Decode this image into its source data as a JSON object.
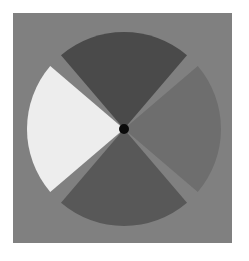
{
  "figure": {
    "canvas": {
      "width": 249,
      "height": 261,
      "background_color": "#ffffff"
    },
    "panel": {
      "name": "gray-backing-square",
      "x": 13,
      "y": 13,
      "width": 219,
      "height": 230,
      "color": "#808080"
    },
    "disc": {
      "center_x": 124,
      "center_y": 129,
      "radius": 97,
      "spoke_gap_degrees": 4.5,
      "spoke_color": "#808080",
      "rotation_degrees": 45
    },
    "hub": {
      "name": "center-pivot-dot",
      "center_x": 124,
      "center_y": 129,
      "radius": 5,
      "color": "#0b0b0b"
    }
  },
  "chart_data": {
    "type": "pie",
    "xlabel": "",
    "ylabel": "",
    "grid": false,
    "legend_position": "none",
    "total_sectors": 4,
    "rotation_degrees": 45,
    "categories": [
      "Top sector",
      "Right sector",
      "Bottom sector",
      "Left sector"
    ],
    "values": [
      25,
      25,
      25,
      25
    ],
    "value_unit": "percent",
    "colors": [
      "#4a4a4a",
      "#6e6e6e",
      "#585858",
      "#ededed"
    ],
    "slices": [
      {
        "label": "Top sector",
        "value": 25,
        "color": "#4a4a4a",
        "shade": "dark gray",
        "start_angle_deg": 225,
        "end_angle_deg": 315
      },
      {
        "label": "Right sector",
        "value": 25,
        "color": "#6e6e6e",
        "shade": "medium gray",
        "start_angle_deg": 315,
        "end_angle_deg": 45
      },
      {
        "label": "Bottom sector",
        "value": 25,
        "color": "#585858",
        "shade": "medium-dark gray",
        "start_angle_deg": 45,
        "end_angle_deg": 135
      },
      {
        "label": "Left sector",
        "value": 25,
        "color": "#ededed",
        "shade": "near white",
        "start_angle_deg": 135,
        "end_angle_deg": 225
      }
    ]
  }
}
